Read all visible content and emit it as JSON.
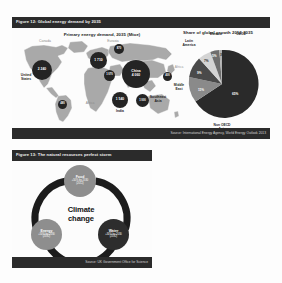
{
  "figure12": {
    "header": "Figure 12: Global energy demand by 2035",
    "source": "Source: International Energy Agency, World Energy Outlook 2013",
    "map_panel": {
      "title": "Primary energy demand, 2035 (Mtoe)",
      "bubbles": [
        {
          "name": "United States",
          "value": "2 240",
          "label": "United\nStates"
        },
        {
          "name": "Europe",
          "value": "1 710",
          "label": "Europe"
        },
        {
          "name": "China",
          "value": "4 060",
          "label": "China"
        },
        {
          "name": "India",
          "value": "1 540",
          "label": "India"
        },
        {
          "name": "Southeast Asia",
          "value": "1 000",
          "label": "Southeast\nAsia"
        },
        {
          "name": "Japan",
          "value": "400",
          "label": "Japan"
        },
        {
          "name": "Russia",
          "value": "870",
          "label": "Russia"
        },
        {
          "name": "Brazil",
          "value": "480",
          "label": "Brazil"
        },
        {
          "name": "Middle East",
          "value": "1 070",
          "label": "Middle\nEast"
        }
      ],
      "region_labels": [
        "Africa",
        "Eurasia",
        "Canada"
      ]
    },
    "pie_panel": {
      "title": "Share of global growth\n2012-2035",
      "slices": [
        {
          "label": "Non OECD\nAsia",
          "value": "65%",
          "pct": 65,
          "color": "#2a2a2a"
        },
        {
          "label": "Middle\nEast",
          "value": "11%",
          "pct": 11,
          "color": "#8a8a8a"
        },
        {
          "label": "Africa",
          "value": "9%",
          "pct": 9,
          "color": "#4a4a4a"
        },
        {
          "label": "Latin\nAmerica",
          "value": "7%",
          "pct": 7,
          "color": "#d4d4d4"
        },
        {
          "label": "Eurasia",
          "value": "5%",
          "pct": 5,
          "color": "#6e6e6e"
        },
        {
          "label": "OECD",
          "value": "3%",
          "pct": 3,
          "color": "#b0b0b0"
        }
      ]
    }
  },
  "figure13": {
    "header": "Figure 13: The natural resources perfect storm",
    "source": "Source: UK Government Office for Science",
    "center": {
      "line1": "Climate",
      "line2": "change"
    },
    "nodes": [
      {
        "name": "food",
        "title": "Food",
        "sub": "+50% by 2030\n(2012)"
      },
      {
        "name": "water",
        "title": "Water",
        "sub": "+30% by 2030\n(2012)"
      },
      {
        "name": "energy",
        "title": "Energy",
        "sub": "+50% by 2030\n(2012)"
      }
    ]
  },
  "colors": {
    "bar": "#2b2b2b",
    "bubble": "#242424",
    "ring": "#1c1c1c",
    "node_grey": "#8e8e8e",
    "node_dark": "#2d2d2d"
  }
}
